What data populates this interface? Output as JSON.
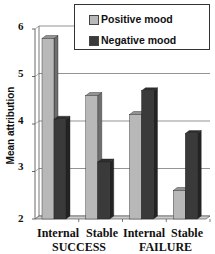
{
  "chart_data": {
    "type": "bar",
    "title": "",
    "xlabel": "",
    "ylabel": "Mean attribution",
    "ylim": [
      2,
      6
    ],
    "yticks": [
      2,
      3,
      4,
      5,
      6
    ],
    "grid": true,
    "style": "3d-bar",
    "legend_position": "top-right",
    "groups": [
      "SUCCESS",
      "FAILURE"
    ],
    "categories": [
      "Internal",
      "Stable",
      "Internal",
      "Stable"
    ],
    "series": [
      {
        "name": "Positive mood",
        "color": "#b8b8b8",
        "values": [
          5.8,
          4.6,
          4.2,
          2.6
        ]
      },
      {
        "name": "Negative mood",
        "color": "#3a3a3a",
        "values": [
          4.1,
          3.2,
          4.7,
          3.8
        ]
      }
    ]
  },
  "legend": {
    "positive": "Positive mood",
    "negative": "Negative mood"
  },
  "axis": {
    "ylabel": "Mean attribution",
    "ticks": [
      "6",
      "5",
      "4",
      "3",
      "2"
    ],
    "categories": [
      "Internal",
      "Stable",
      "Internal",
      "Stable"
    ],
    "groups": [
      "SUCCESS",
      "FAILURE"
    ]
  }
}
